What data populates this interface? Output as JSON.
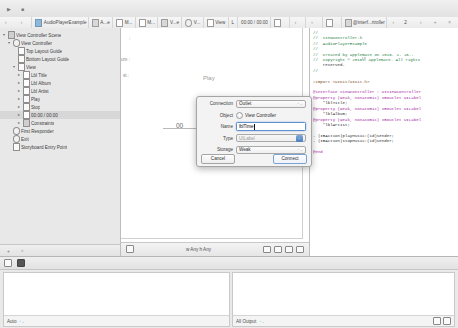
{
  "toolbar": {
    "run_icon": "▶",
    "stop_icon": "■",
    "scheme_label": "AudioPlayerExample",
    "device_label": "iPhone 6",
    "status_label": "",
    "editor_icons": [
      "standard-editor",
      "assistant-editor",
      "version-editor"
    ],
    "view_icons": [
      "navigator-toggle",
      "debug-toggle",
      "utilities-toggle"
    ]
  },
  "jumpbar": {
    "segments": [
      {
        "label": "AudioPlayerExample",
        "icon": "project-icon"
      },
      {
        "label": "A...e",
        "icon": "folder-icon"
      },
      {
        "label": "M...",
        "icon": "file-icon"
      },
      {
        "label": "M...",
        "icon": "file-icon"
      },
      {
        "label": "V...e",
        "icon": "storyboard-icon"
      },
      {
        "label": "V...",
        "icon": "scene-icon"
      },
      {
        "label": "View",
        "icon": "view-icon"
      },
      {
        "label": "L",
        "icon": "label-icon"
      },
      {
        "label": "00:00 / 00:00",
        "icon": ""
      }
    ],
    "right_segments": [
      {
        "label": "@interf...rtroller",
        "icon": "header-file-icon"
      }
    ],
    "right_nav": {
      "prev": "‹",
      "count": "2",
      "next": "›",
      "add": "+",
      "close": "×"
    }
  },
  "navigator": {
    "outline": [
      {
        "label": "View Controller Scene",
        "depth": 0,
        "icon": "scene-icon",
        "disclosure": "▾",
        "selected": false
      },
      {
        "label": "View Controller",
        "depth": 1,
        "icon": "viewcontroller-icon",
        "disclosure": "▾",
        "selected": false
      },
      {
        "label": "Top Layout Guide",
        "depth": 2,
        "icon": "guide-icon",
        "disclosure": "",
        "selected": false
      },
      {
        "label": "Bottom Layout Guide",
        "depth": 2,
        "icon": "guide-icon",
        "disclosure": "",
        "selected": false
      },
      {
        "label": "View",
        "depth": 2,
        "icon": "view-icon",
        "disclosure": "▾",
        "selected": false
      },
      {
        "label": "Lbl Title",
        "depth": 3,
        "icon": "label-icon",
        "disclosure": "▸",
        "selected": false
      },
      {
        "label": "Lbl Album",
        "depth": 3,
        "icon": "label-icon",
        "disclosure": "▸",
        "selected": false
      },
      {
        "label": "Lbl Artist",
        "depth": 3,
        "icon": "label-icon",
        "disclosure": "▸",
        "selected": false
      },
      {
        "label": "Play",
        "depth": 3,
        "icon": "button-icon",
        "disclosure": "▸",
        "selected": false
      },
      {
        "label": "Stop",
        "depth": 3,
        "icon": "button-icon",
        "disclosure": "▸",
        "selected": false
      },
      {
        "label": "00:00 / 00:00",
        "depth": 3,
        "icon": "label-icon",
        "disclosure": "▸",
        "selected": true
      },
      {
        "label": "Constraints",
        "depth": 3,
        "icon": "constraints-icon",
        "disclosure": "▸",
        "selected": false
      },
      {
        "label": "First Responder",
        "depth": 1,
        "icon": "first-responder-icon",
        "disclosure": "",
        "selected": false
      },
      {
        "label": "Exit",
        "depth": 1,
        "icon": "exit-icon",
        "disclosure": "",
        "selected": false
      },
      {
        "label": "Storyboard Entry Point",
        "depth": 1,
        "icon": "entry-point-icon",
        "disclosure": "",
        "selected": false
      }
    ]
  },
  "canvas": {
    "labels": [
      {
        "text": ":",
        "x": 8,
        "y": 8
      },
      {
        "text": "um :",
        "x": 0,
        "y": 28
      },
      {
        "text": "st :",
        "x": 2,
        "y": 44
      }
    ],
    "play_label": "Play",
    "time_label": "00",
    "bottom_bar": {
      "size_class": "w Any  h Any",
      "left_icon": "view-as-icon",
      "right_icons": [
        "align-icon",
        "pin-icon",
        "resolve-icon",
        "resize-icon"
      ]
    }
  },
  "dialog": {
    "title": "Connection Dialog",
    "rows": [
      {
        "label": "Connection",
        "value": "Outlet",
        "kind": "popup"
      },
      {
        "label": "Object",
        "value": "View Controller",
        "kind": "radio"
      },
      {
        "label": "Name",
        "value": "lblTime",
        "kind": "input",
        "placeholder": ""
      },
      {
        "label": "Type",
        "value": "UILabel",
        "kind": "popup-disabled"
      },
      {
        "label": "Storage",
        "value": "Weak",
        "kind": "popup"
      }
    ],
    "cancel_label": "Cancel",
    "connect_label": "Connect"
  },
  "editor": {
    "code_lines": [
      "//",
      "//  ViewController.h",
      "//  AudioPlayerExample",
      "//",
      "//  Created by applemate on 2016. 1. 26..",
      "//  Copyright © 2016년 applemate. All rights",
      "    reserved.",
      "//",
      "",
      "#import <UIKit/UIKit.h>",
      "",
      "@interface ViewController : UIViewController",
      "@property (weak, nonatomic) IBOutlet UILabel",
      "    *lblTitle;",
      "@property (weak, nonatomic) IBOutlet UILabel",
      "    *lblAlbum;",
      "@property (weak, nonatomic) IBOutlet UILabel",
      "    *lblArtist;",
      "",
      "- (IBAction)playMusic:(id)sender;",
      "- (IBAction)stopMusic:(id)sender;",
      "",
      "@end"
    ]
  },
  "debug": {
    "variables_scope": "Auto",
    "console_scope": "All Output",
    "bar_icons": [
      "hide-debug-icon",
      "camera-icon"
    ],
    "console_right_icons": [
      "trash-icon",
      "split-view-icon"
    ]
  }
}
